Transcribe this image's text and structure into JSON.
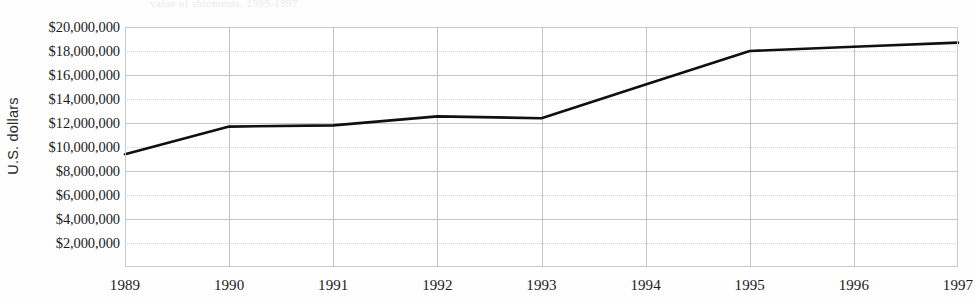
{
  "figure": {
    "caption_remnant": "value of shipments, 1989-1997",
    "background_color": "#ffffff",
    "line_color": "#101010",
    "grid_color": "#c4c4c8",
    "frame_color": "#c9c9cd"
  },
  "chart_data": {
    "type": "line",
    "title": "",
    "subtitle": "",
    "xlabel": "",
    "ylabel": "U.S. dollars",
    "x": [
      1989,
      1990,
      1991,
      1992,
      1993,
      1994,
      1995,
      1996,
      1997
    ],
    "categories": [
      "1989",
      "1990",
      "1991",
      "1992",
      "1993",
      "1994",
      "1995",
      "1996",
      "1997"
    ],
    "values": [
      9400000,
      11700000,
      11800000,
      12550000,
      12400000,
      15200000,
      18000000,
      18350000,
      18700000
    ],
    "series": [
      {
        "name": "U.S. dollars",
        "color": "#101010",
        "values": [
          9400000,
          11700000,
          11800000,
          12550000,
          12400000,
          15200000,
          18000000,
          18350000,
          18700000
        ]
      }
    ],
    "xlim": [
      1989,
      1997
    ],
    "ylim": [
      0,
      20000000
    ],
    "xtick_labels": [
      "1989",
      "1990",
      "1991",
      "1992",
      "1993",
      "1994",
      "1995",
      "1996",
      "1997"
    ],
    "ytick_values": [
      2000000,
      4000000,
      6000000,
      8000000,
      10000000,
      12000000,
      14000000,
      16000000,
      18000000,
      20000000
    ],
    "ytick_labels": [
      "$2,000,000",
      "$4,000,000",
      "$6,000,000",
      "$8,000,000",
      "$10,000,000",
      "$12,000,000",
      "$14,000,000",
      "$16,000,000",
      "$18,000,000",
      "$20,000,000"
    ],
    "grid": true,
    "grid_axes": "both",
    "legend": false,
    "legend_position": "none",
    "markers": false,
    "annotations": []
  }
}
